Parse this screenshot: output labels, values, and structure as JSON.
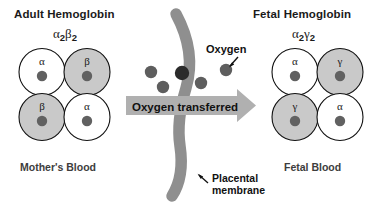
{
  "figure": {
    "background_color": "#ffffff"
  },
  "adult": {
    "heading": "Adult Hemoglobin",
    "formula_parts": {
      "a": "α",
      "a_sub": "2",
      "b": "β",
      "b_sub": "2"
    },
    "blood_label": "Mother's Blood",
    "subunits": [
      {
        "letter": "α",
        "position": "top-left",
        "fill": "#ffffff"
      },
      {
        "letter": "β",
        "position": "top-right",
        "fill": "#c9c9c9"
      },
      {
        "letter": "β",
        "position": "bottom-left",
        "fill": "#c9c9c9"
      },
      {
        "letter": "α",
        "position": "bottom-right",
        "fill": "#ffffff"
      }
    ]
  },
  "fetal": {
    "heading": "Fetal Hemoglobin",
    "formula_parts": {
      "a": "α",
      "a_sub": "2",
      "b": "γ",
      "b_sub": "2"
    },
    "blood_label": "Fetal Blood",
    "subunits": [
      {
        "letter": "α",
        "position": "top-left",
        "fill": "#ffffff"
      },
      {
        "letter": "γ",
        "position": "top-right",
        "fill": "#c9c9c9"
      },
      {
        "letter": "γ",
        "position": "bottom-left",
        "fill": "#c9c9c9"
      },
      {
        "letter": "α",
        "position": "bottom-right",
        "fill": "#ffffff"
      }
    ]
  },
  "center": {
    "membrane_label_line1": "Placental",
    "membrane_label_line2": "membrane",
    "oxygen_label": "Oxygen",
    "transfer_arrow_label": "Oxygen transferred",
    "oxygen_molecule_count": 5,
    "direction": "mother-to-fetus"
  },
  "colors": {
    "cell_gray": "#c9c9c9",
    "cell_white": "#ffffff",
    "cell_outline": "#111111",
    "nucleus": "#616161",
    "membrane": "#8f8f8f",
    "arrow": "#b0b0b0",
    "oxygen_dot": "#5e5e5e",
    "oxygen_dot_dark": "#2b2b2b",
    "text": "#1a1a1a",
    "label_text": "#3d3d3d"
  }
}
